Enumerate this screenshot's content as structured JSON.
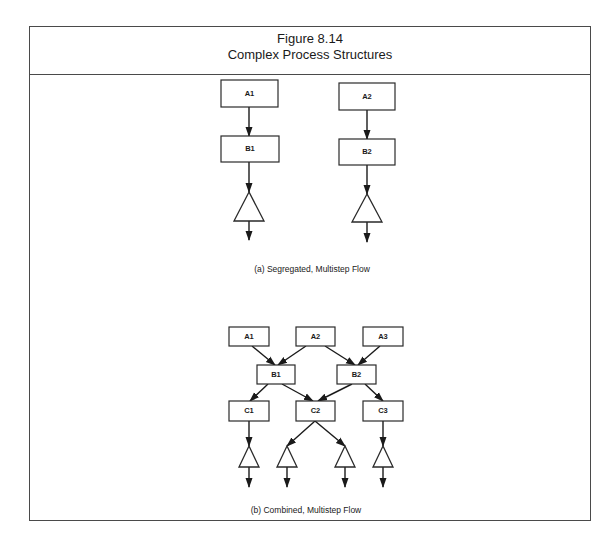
{
  "figure": {
    "number": "Figure 8.14",
    "title": "Complex Process Structures"
  },
  "diagrams": [
    {
      "id": "a",
      "caption": "(a) Segregated, Multistep Flow",
      "caption_pos": [
        312,
        272
      ],
      "nodes": [
        {
          "id": "A1",
          "label": "A1",
          "x": 221,
          "y": 80,
          "w": 57,
          "h": 27,
          "font": 8
        },
        {
          "id": "B1",
          "label": "B1",
          "x": 221,
          "y": 136,
          "w": 58,
          "h": 26,
          "font": 8
        },
        {
          "id": "A2",
          "label": "A2",
          "x": 339,
          "y": 83,
          "w": 56,
          "h": 27,
          "font": 8
        },
        {
          "id": "B2",
          "label": "B2",
          "x": 339,
          "y": 139,
          "w": 56,
          "h": 26,
          "font": 8
        }
      ],
      "triangles": [
        {
          "cx": 249,
          "top": 192,
          "base": 221,
          "half": 15
        },
        {
          "cx": 367,
          "top": 194,
          "base": 222,
          "half": 15
        }
      ],
      "edges": [
        {
          "x1": 249,
          "y1": 107,
          "x2": 249,
          "y2": 136
        },
        {
          "x1": 249,
          "y1": 162,
          "x2": 249,
          "y2": 192
        },
        {
          "x1": 249,
          "y1": 221,
          "x2": 249,
          "y2": 240
        },
        {
          "x1": 367,
          "y1": 110,
          "x2": 367,
          "y2": 139
        },
        {
          "x1": 367,
          "y1": 165,
          "x2": 367,
          "y2": 194
        },
        {
          "x1": 367,
          "y1": 222,
          "x2": 367,
          "y2": 242
        }
      ]
    },
    {
      "id": "b",
      "caption": "(b) Combined, Multistep Flow",
      "caption_pos": [
        306,
        513
      ],
      "nodes": [
        {
          "id": "A1",
          "label": "A1",
          "x": 229,
          "y": 327,
          "w": 40,
          "h": 19,
          "font": 6.5
        },
        {
          "id": "A2",
          "label": "A2",
          "x": 296,
          "y": 327,
          "w": 39,
          "h": 19,
          "font": 6.5
        },
        {
          "id": "A3",
          "label": "A3",
          "x": 363,
          "y": 327,
          "w": 40,
          "h": 19,
          "font": 6.5
        },
        {
          "id": "B1",
          "label": "B1",
          "x": 257,
          "y": 365,
          "w": 38,
          "h": 19,
          "font": 6.5
        },
        {
          "id": "B2",
          "label": "B2",
          "x": 337,
          "y": 365,
          "w": 39,
          "h": 19,
          "font": 6.5
        },
        {
          "id": "C1",
          "label": "C1",
          "x": 229,
          "y": 401,
          "w": 40,
          "h": 20,
          "font": 6.5
        },
        {
          "id": "C2",
          "label": "C2",
          "x": 296,
          "y": 401,
          "w": 39,
          "h": 20,
          "font": 6.5
        },
        {
          "id": "C3",
          "label": "C3",
          "x": 363,
          "y": 401,
          "w": 40,
          "h": 20,
          "font": 6.5
        }
      ],
      "triangles": [
        {
          "cx": 249,
          "top": 446,
          "base": 467,
          "half": 10
        },
        {
          "cx": 287,
          "top": 446,
          "base": 467,
          "half": 10
        },
        {
          "cx": 345,
          "top": 446,
          "base": 467,
          "half": 10
        },
        {
          "cx": 383,
          "top": 446,
          "base": 467,
          "half": 10
        }
      ],
      "edges": [
        {
          "x1": 252,
          "y1": 346,
          "x2": 275,
          "y2": 365
        },
        {
          "x1": 306,
          "y1": 346,
          "x2": 278,
          "y2": 365
        },
        {
          "x1": 325,
          "y1": 346,
          "x2": 355,
          "y2": 365
        },
        {
          "x1": 380,
          "y1": 346,
          "x2": 358,
          "y2": 365
        },
        {
          "x1": 268,
          "y1": 384,
          "x2": 250,
          "y2": 401
        },
        {
          "x1": 282,
          "y1": 384,
          "x2": 313,
          "y2": 401
        },
        {
          "x1": 352,
          "y1": 384,
          "x2": 318,
          "y2": 401
        },
        {
          "x1": 365,
          "y1": 384,
          "x2": 383,
          "y2": 401
        },
        {
          "x1": 249,
          "y1": 421,
          "x2": 249,
          "y2": 446
        },
        {
          "x1": 315,
          "y1": 421,
          "x2": 287,
          "y2": 446
        },
        {
          "x1": 315,
          "y1": 421,
          "x2": 345,
          "y2": 446
        },
        {
          "x1": 383,
          "y1": 421,
          "x2": 383,
          "y2": 446
        },
        {
          "x1": 249,
          "y1": 467,
          "x2": 249,
          "y2": 487
        },
        {
          "x1": 287,
          "y1": 467,
          "x2": 287,
          "y2": 487
        },
        {
          "x1": 345,
          "y1": 467,
          "x2": 345,
          "y2": 487
        },
        {
          "x1": 383,
          "y1": 467,
          "x2": 383,
          "y2": 487
        }
      ]
    }
  ]
}
